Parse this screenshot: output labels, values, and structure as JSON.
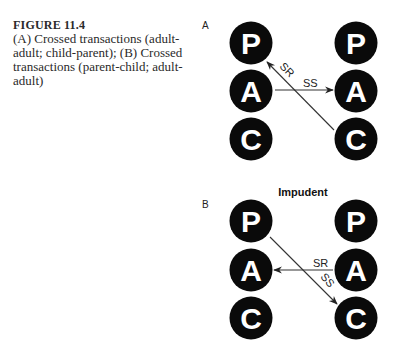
{
  "caption": {
    "title": "FIGURE 11.4",
    "lines": [
      "(A) Crossed transactions (adult-",
      "adult; child-parent); (B) Crossed",
      "transactions (parent-child; adult-",
      "adult)"
    ]
  },
  "panels": {
    "a": {
      "label": "A",
      "heading": "",
      "left_nodes": [
        "P",
        "A",
        "C"
      ],
      "right_nodes": [
        "P",
        "A",
        "C"
      ],
      "arrows": [
        {
          "label": "SS",
          "from": "left-A",
          "to": "right-A"
        },
        {
          "label": "SR",
          "from": "right-C",
          "to": "left-P"
        }
      ]
    },
    "b": {
      "label": "B",
      "heading": "Impudent",
      "left_nodes": [
        "P",
        "A",
        "C"
      ],
      "right_nodes": [
        "P",
        "A",
        "C"
      ],
      "arrows": [
        {
          "label": "SS",
          "from": "left-P",
          "to": "right-C"
        },
        {
          "label": "SR",
          "from": "right-A",
          "to": "left-A"
        }
      ]
    }
  },
  "colors": {
    "node_fill": "#0a0a0a",
    "node_text": "#ffffff",
    "line": "#333333"
  }
}
